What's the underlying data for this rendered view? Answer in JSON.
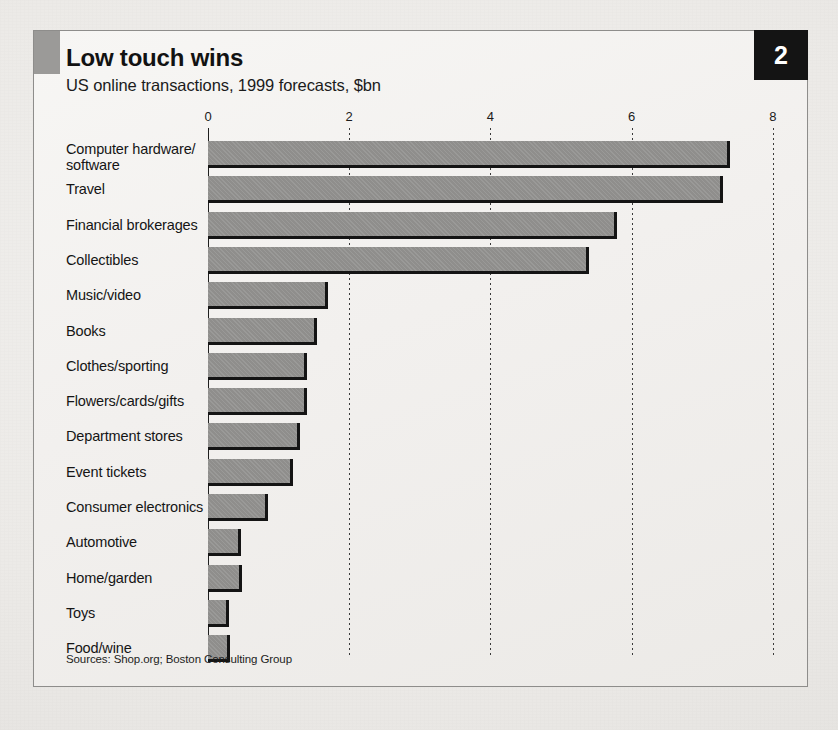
{
  "chart_data": {
    "type": "bar",
    "orientation": "horizontal",
    "title": "Low touch wins",
    "subtitle": "US online transactions, 1999 forecasts, $bn",
    "badge": "2",
    "xlabel": "",
    "ylabel": "",
    "xlim": [
      0,
      8
    ],
    "xticks": [
      0,
      2,
      4,
      6,
      8
    ],
    "xtick_labels": [
      "0",
      "2",
      "4",
      "6",
      "8"
    ],
    "grid": "vertical-dotted",
    "legend": "none",
    "source": "Sources: Shop.org; Boston Consulting Group",
    "categories": [
      "Computer hardware/\nsoftware",
      "Travel",
      "Financial brokerages",
      "Collectibles",
      "Music/video",
      "Books",
      "Clothes/sporting",
      "Flowers/cards/gifts",
      "Department stores",
      "Event tickets",
      "Consumer electronics",
      "Automotive",
      "Home/garden",
      "Toys",
      "Food/wine"
    ],
    "values": [
      7.4,
      7.3,
      5.8,
      5.4,
      1.7,
      1.55,
      1.4,
      1.4,
      1.3,
      1.2,
      0.85,
      0.47,
      0.48,
      0.3,
      0.31
    ]
  },
  "colors": {
    "bar_fill": "#8f8e8c",
    "bar_edge": "#141414",
    "badge_bg": "#141414",
    "badge_text": "#ffffff",
    "accent_block": "#9b9a98",
    "frame_border": "#8e8d8b",
    "text": "#151515"
  }
}
